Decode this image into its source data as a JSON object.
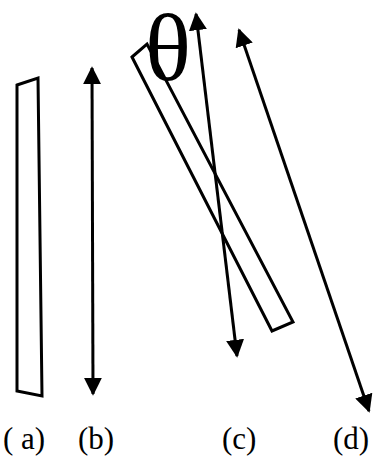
{
  "figure": {
    "symbol": "θ",
    "panels": [
      {
        "id": "a",
        "label": "( a)",
        "element": "slightly tapered near-vertical rectangle (outline)"
      },
      {
        "id": "b",
        "label": "(b)",
        "element": "vertical double-headed arrow"
      },
      {
        "id": "c",
        "label": "(c)",
        "element": "tilted rectangle with double-headed arrow, angle θ between them"
      },
      {
        "id": "d",
        "label": "(d)",
        "element": "tilted double-headed arrow"
      }
    ]
  },
  "colors": {
    "stroke": "#000000",
    "background": "#ffffff"
  }
}
